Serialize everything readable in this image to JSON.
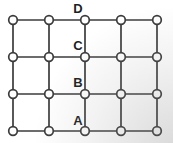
{
  "diagram": {
    "type": "lattice-grid",
    "background_color": "#ffffff",
    "corner_shade_color": "#e9e9e9",
    "line_color": "#3b3b3b",
    "line_width": 1.7,
    "node_fill": "#ffffff",
    "node_stroke": "#3b3b3b",
    "node_radius": 4.3,
    "columns_x": [
      13,
      49,
      85,
      121,
      157
    ],
    "rows_y": [
      20,
      57,
      94,
      131
    ],
    "label_color": "#1f1f1f",
    "label_font_size": 13,
    "labels": [
      {
        "text": "D",
        "x": 78,
        "y": 13,
        "row": 1,
        "col": 3
      },
      {
        "text": "C",
        "x": 78,
        "y": 50,
        "row": 2,
        "col": 3
      },
      {
        "text": "B",
        "x": 78,
        "y": 87,
        "row": 3,
        "col": 3
      },
      {
        "text": "A",
        "x": 78,
        "y": 125,
        "row": 4,
        "col": 3
      }
    ]
  }
}
